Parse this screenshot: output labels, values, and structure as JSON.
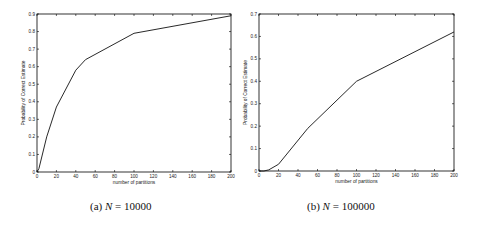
{
  "chart_data": [
    {
      "type": "line",
      "title": "",
      "caption": {
        "label": "(a)",
        "variable": "N",
        "equals": "=",
        "value": "10000"
      },
      "xlabel": "number of partitions",
      "ylabel": "Probability of Correct Estimate",
      "xlim": [
        0,
        200
      ],
      "ylim": [
        0,
        0.9
      ],
      "xticks": [
        0,
        20,
        40,
        60,
        80,
        100,
        120,
        140,
        160,
        180,
        200
      ],
      "xtick_labels": [
        "0",
        "20",
        "40",
        "60",
        "80",
        "100",
        "120",
        "140",
        "160",
        "180",
        "200"
      ],
      "yticks": [
        0,
        0.1,
        0.2,
        0.3,
        0.4,
        0.5,
        0.6,
        0.7,
        0.8,
        0.9
      ],
      "ytick_labels": [
        "0",
        "0.1",
        "0.2",
        "0.3",
        "0.4",
        "0.5",
        "0.6",
        "0.7",
        "0.8",
        "0.9"
      ],
      "grid": false,
      "series": [
        {
          "name": "N=10000",
          "x": [
            0,
            2,
            10,
            20,
            40,
            50,
            100,
            200
          ],
          "y": [
            0,
            0.02,
            0.2,
            0.37,
            0.58,
            0.64,
            0.79,
            0.89
          ]
        }
      ]
    },
    {
      "type": "line",
      "title": "",
      "caption": {
        "label": "(b)",
        "variable": "N",
        "equals": "=",
        "value": "100000"
      },
      "xlabel": "number of partitions",
      "ylabel": "Probability of Correct Estimate",
      "xlim": [
        0,
        200
      ],
      "ylim": [
        0,
        0.7
      ],
      "xticks": [
        0,
        20,
        40,
        60,
        80,
        100,
        120,
        140,
        160,
        180,
        200
      ],
      "xtick_labels": [
        "0",
        "20",
        "40",
        "60",
        "80",
        "100",
        "120",
        "140",
        "160",
        "180",
        "200"
      ],
      "yticks": [
        0,
        0.1,
        0.2,
        0.3,
        0.4,
        0.5,
        0.6,
        0.7
      ],
      "ytick_labels": [
        "0",
        "0.1",
        "0.2",
        "0.3",
        "0.4",
        "0.5",
        "0.6",
        "0.7"
      ],
      "grid": false,
      "series": [
        {
          "name": "N=100000",
          "x": [
            0,
            5,
            10,
            20,
            50,
            100,
            200
          ],
          "y": [
            0,
            0.0,
            0.005,
            0.03,
            0.19,
            0.4,
            0.62
          ]
        }
      ]
    }
  ]
}
